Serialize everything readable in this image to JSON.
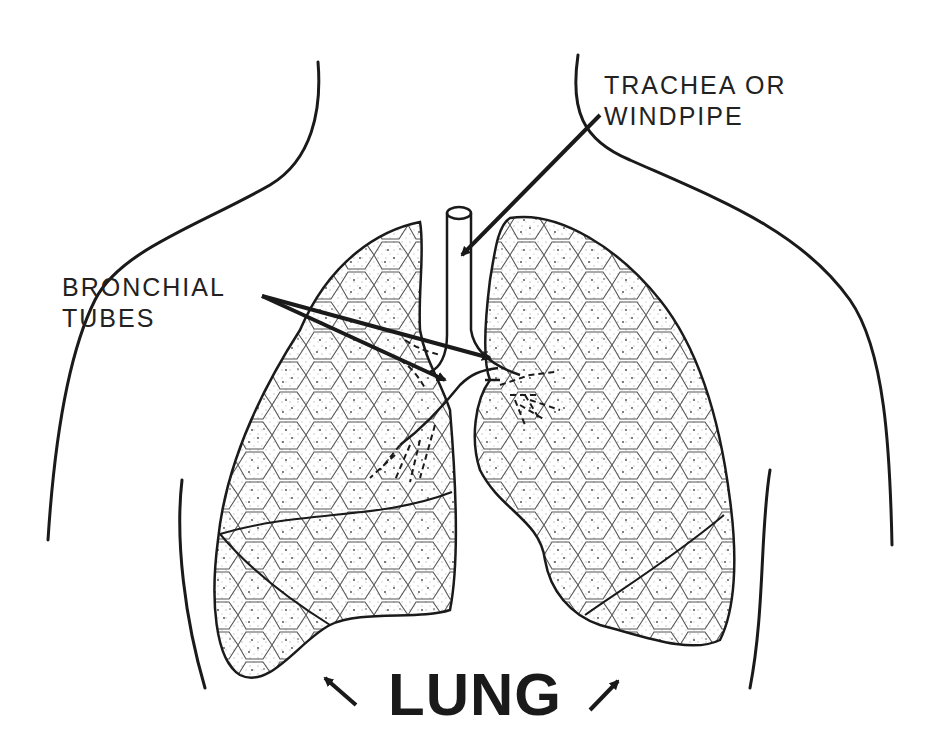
{
  "diagram": {
    "type": "anatomical-illustration",
    "colors": {
      "ink": "#1a1a1a",
      "background": "#ffffff"
    },
    "labels": {
      "trachea": {
        "line1": "TRACHEA OR",
        "line2": "WINDPIPE"
      },
      "bronchial": {
        "line1": "BRONCHIAL",
        "line2": "TUBES"
      },
      "lung": "LUNG"
    },
    "parts": [
      "body-outline",
      "trachea",
      "left-lung",
      "right-lung",
      "bronchial-tubes",
      "pointer-arrows"
    ]
  }
}
